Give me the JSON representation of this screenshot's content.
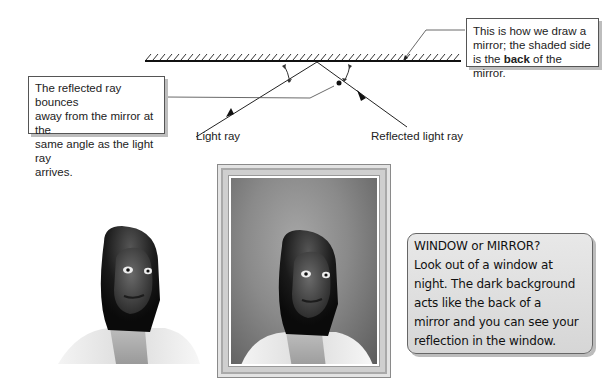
{
  "diagram": {
    "mirror": {
      "description": "Mirror drawn as a line with hatched back side",
      "x_start": 145,
      "x_end": 460,
      "y": 61
    },
    "rays": {
      "incident_label": "Light ray",
      "reflected_label": "Reflected light ray"
    },
    "callouts": {
      "left": {
        "lines": [
          "The reflected ray bounces",
          "away from the mirror at the",
          "same angle as the light ray",
          "arrives."
        ]
      },
      "right": {
        "line1": "This is how we draw a",
        "line2": "mirror; the shaded side",
        "line3_prefix": "is the ",
        "line3_bold": "back",
        "line3_suffix": " of the mirror."
      }
    }
  },
  "illustration": {
    "left_figure": "Woman facing viewer (real person)",
    "framed_figure": "Woman's reflection inside a framed mirror/window",
    "tip_box": {
      "lines": [
        "WINDOW or MIRROR?",
        "Look out of a window at",
        "night. The dark background",
        "acts like the back of a",
        "mirror and you can see your",
        "reflection in the window."
      ]
    }
  },
  "colors": {
    "line": "#222222",
    "callout_shadow": "#bdbdbd",
    "tip_bg": "#dedede",
    "frame": "#cfcfcf"
  }
}
